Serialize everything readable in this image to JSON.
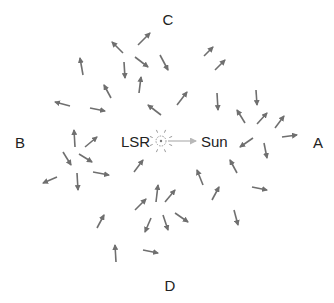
{
  "diagram": {
    "title": "",
    "labels": {
      "top": "C",
      "bottom": "D",
      "left": "B",
      "right": "A",
      "lsr": "LSR",
      "sun": "Sun"
    },
    "colors": {
      "star_arrow": "#6f6f6f",
      "sun_arrow": "#b8b8b8",
      "lsr_symbol": "#9a9a9a",
      "text": "#222222"
    },
    "lsr_position": [
      161,
      141
    ],
    "sun_arrow": {
      "from": [
        168,
        141
      ],
      "to": [
        196,
        141
      ]
    },
    "star_arrows": [
      {
        "from": [
          83,
          75
        ],
        "to": [
          80,
          58
        ]
      },
      {
        "from": [
          123,
          53
        ],
        "to": [
          112,
          42
        ]
      },
      {
        "from": [
          138,
          45
        ],
        "to": [
          150,
          33
        ]
      },
      {
        "from": [
          124,
          62
        ],
        "to": [
          125,
          78
        ]
      },
      {
        "from": [
          135,
          57
        ],
        "to": [
          148,
          67
        ]
      },
      {
        "from": [
          160,
          55
        ],
        "to": [
          168,
          70
        ]
      },
      {
        "from": [
          111,
          98
        ],
        "to": [
          104,
          85
        ]
      },
      {
        "from": [
          139,
          93
        ],
        "to": [
          141,
          77
        ]
      },
      {
        "from": [
          70,
          106
        ],
        "to": [
          55,
          102
        ]
      },
      {
        "from": [
          90,
          108
        ],
        "to": [
          105,
          111
        ]
      },
      {
        "from": [
          161,
          115
        ],
        "to": [
          148,
          105
        ]
      },
      {
        "from": [
          177,
          105
        ],
        "to": [
          187,
          92
        ]
      },
      {
        "from": [
          204,
          56
        ],
        "to": [
          213,
          47
        ]
      },
      {
        "from": [
          215,
          70
        ],
        "to": [
          225,
          60
        ]
      },
      {
        "from": [
          217,
          93
        ],
        "to": [
          218,
          110
        ]
      },
      {
        "from": [
          256,
          90
        ],
        "to": [
          257,
          105
        ]
      },
      {
        "from": [
          245,
          123
        ],
        "to": [
          237,
          110
        ]
      },
      {
        "from": [
          257,
          124
        ],
        "to": [
          267,
          113
        ]
      },
      {
        "from": [
          275,
          128
        ],
        "to": [
          284,
          116
        ]
      },
      {
        "from": [
          282,
          137
        ],
        "to": [
          297,
          135
        ]
      },
      {
        "from": [
          253,
          138
        ],
        "to": [
          240,
          147
        ]
      },
      {
        "from": [
          264,
          143
        ],
        "to": [
          267,
          158
        ]
      },
      {
        "from": [
          75,
          147
        ],
        "to": [
          74,
          130
        ]
      },
      {
        "from": [
          85,
          147
        ],
        "to": [
          97,
          137
        ]
      },
      {
        "from": [
          63,
          152
        ],
        "to": [
          71,
          165
        ]
      },
      {
        "from": [
          79,
          154
        ],
        "to": [
          92,
          162
        ]
      },
      {
        "from": [
          93,
          172
        ],
        "to": [
          109,
          175
        ]
      },
      {
        "from": [
          57,
          177
        ],
        "to": [
          43,
          183
        ]
      },
      {
        "from": [
          77,
          173
        ],
        "to": [
          78,
          190
        ]
      },
      {
        "from": [
          134,
          172
        ],
        "to": [
          143,
          160
        ]
      },
      {
        "from": [
          237,
          173
        ],
        "to": [
          230,
          160
        ]
      },
      {
        "from": [
          203,
          185
        ],
        "to": [
          197,
          170
        ]
      },
      {
        "from": [
          212,
          200
        ],
        "to": [
          219,
          187
        ]
      },
      {
        "from": [
          252,
          187
        ],
        "to": [
          267,
          190
        ]
      },
      {
        "from": [
          234,
          210
        ],
        "to": [
          238,
          225
        ]
      },
      {
        "from": [
          156,
          202
        ],
        "to": [
          158,
          185
        ]
      },
      {
        "from": [
          165,
          202
        ],
        "to": [
          175,
          190
        ]
      },
      {
        "from": [
          135,
          210
        ],
        "to": [
          146,
          199
        ]
      },
      {
        "from": [
          175,
          213
        ],
        "to": [
          188,
          222
        ]
      },
      {
        "from": [
          163,
          215
        ],
        "to": [
          168,
          230
        ]
      },
      {
        "from": [
          151,
          218
        ],
        "to": [
          145,
          232
        ]
      },
      {
        "from": [
          97,
          228
        ],
        "to": [
          104,
          215
        ]
      },
      {
        "from": [
          116,
          262
        ],
        "to": [
          115,
          245
        ]
      },
      {
        "from": [
          143,
          250
        ],
        "to": [
          158,
          253
        ]
      }
    ]
  }
}
